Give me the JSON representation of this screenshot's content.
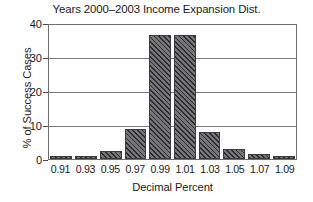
{
  "chart_data": {
    "type": "bar",
    "title": "Years 2000–2003 Income Expansion Dist.",
    "xlabel": "Decimal Percent",
    "ylabel": "% of Success Cases",
    "categories": [
      "0.91",
      "0.93",
      "0.95",
      "0.97",
      "0.99",
      "1.01",
      "1.03",
      "1.05",
      "1.07",
      "1.09"
    ],
    "values": [
      1,
      1,
      2.5,
      9,
      37,
      37,
      8,
      3,
      1.5,
      1
    ],
    "ylim": [
      0,
      40
    ],
    "yticks": [
      "40",
      "30",
      "20",
      "10",
      "0"
    ],
    "ytick_values": [
      40,
      30,
      20,
      10,
      0
    ],
    "grid": "horizontal",
    "legend": "none",
    "bar_color": "#77777a",
    "bar_hatch": "diagonal",
    "frame_color": "#6e6e6e"
  }
}
